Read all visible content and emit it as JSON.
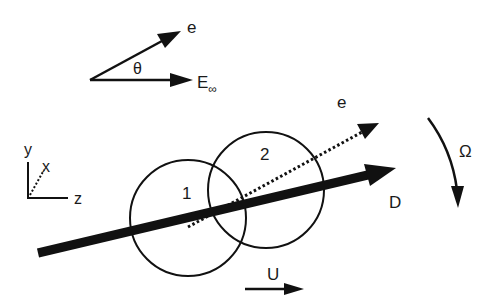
{
  "diagram": {
    "angle_inset": {
      "vector_e_label": "e",
      "angle_label": "θ",
      "field_label": "E",
      "field_subscript": "∞"
    },
    "axes": {
      "y_label": "y",
      "x_label": "x",
      "z_label": "z"
    },
    "particles": [
      {
        "label": "1"
      },
      {
        "label": "2"
      }
    ],
    "vectors": {
      "dipole_label": "D",
      "orientation_label": "e",
      "rotation_label": "Ω",
      "velocity_label": "U"
    },
    "colors": {
      "stroke": "#111111",
      "background": "#ffffff"
    }
  }
}
